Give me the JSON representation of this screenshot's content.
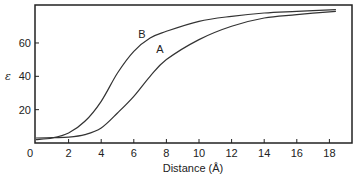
{
  "chart_data": {
    "type": "line",
    "title": "",
    "xlabel": "Distance (Å)",
    "ylabel": "ε",
    "xlim": [
      0,
      19.5
    ],
    "ylim": [
      0,
      82
    ],
    "x_ticks": [
      0,
      2,
      4,
      6,
      8,
      10,
      12,
      14,
      16,
      18
    ],
    "y_ticks": [
      20,
      40,
      60
    ],
    "grid": false,
    "legend": "inline curve labels",
    "series": [
      {
        "name": "B",
        "x": [
          0,
          1,
          2,
          3,
          4,
          5,
          6,
          7,
          8,
          10,
          12,
          14,
          16,
          18.4
        ],
        "values": [
          2,
          3,
          6,
          13,
          25,
          42,
          55,
          63,
          67,
          73,
          76,
          78,
          79,
          80
        ],
        "label_pos": [
          6.5,
          63
        ]
      },
      {
        "name": "A",
        "x": [
          0,
          1,
          2,
          3,
          4,
          5,
          6,
          7,
          8,
          10,
          12,
          14,
          16,
          18.4
        ],
        "values": [
          3,
          3.2,
          3.5,
          5,
          9,
          18,
          28,
          40,
          50,
          62,
          70,
          75,
          77,
          79
        ],
        "label_pos": [
          7.6,
          54
        ]
      }
    ]
  }
}
